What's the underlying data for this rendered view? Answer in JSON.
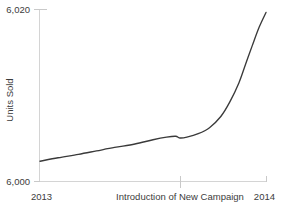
{
  "chart_data": {
    "type": "line",
    "title": "",
    "subtitle": "",
    "xlabel": "",
    "ylabel": "Units Sold",
    "ylim": [
      6000,
      6020
    ],
    "xlim": [
      2013,
      2014
    ],
    "grid": false,
    "legend": null,
    "y_ticks": [
      "6,000",
      "6,020"
    ],
    "y_tick_values": [
      6000,
      6020
    ],
    "x_ticks": [
      "2013",
      "Introduction of New Campaign",
      "2014"
    ],
    "x_tick_values": [
      2013,
      2013.62,
      2014
    ],
    "annotations": [
      {
        "label": "Introduction of New Campaign",
        "x": 2013.62
      }
    ],
    "series": [
      {
        "name": "Units Sold",
        "color": "#3a3a3a",
        "x": [
          2013.0,
          2013.08,
          2013.17,
          2013.25,
          2013.33,
          2013.42,
          2013.5,
          2013.56,
          2013.6,
          2013.62,
          2013.65,
          2013.7,
          2013.75,
          2013.8,
          2013.84,
          2013.88,
          2013.91,
          2013.94,
          2013.97,
          2014.0
        ],
        "y": [
          6002.3,
          6002.7,
          6003.1,
          6003.5,
          6003.9,
          6004.3,
          6004.8,
          6005.1,
          6005.2,
          6005.0,
          6005.1,
          6005.5,
          6006.2,
          6007.5,
          6009.2,
          6011.4,
          6013.6,
          6015.8,
          6017.9,
          6019.6
        ]
      }
    ]
  },
  "axes": {
    "y_label": "Units Sold",
    "y_tick_top": "6,020",
    "y_tick_bottom": "6,000",
    "x_tick_left": "2013",
    "x_tick_mid": "Introduction of New Campaign",
    "x_tick_right": "2014"
  },
  "colors": {
    "curve": "#3a3a3a",
    "axis": "#d4d4d4",
    "tick": "#c9c9c9",
    "text": "#3c3c3c",
    "background": "#ffffff"
  }
}
